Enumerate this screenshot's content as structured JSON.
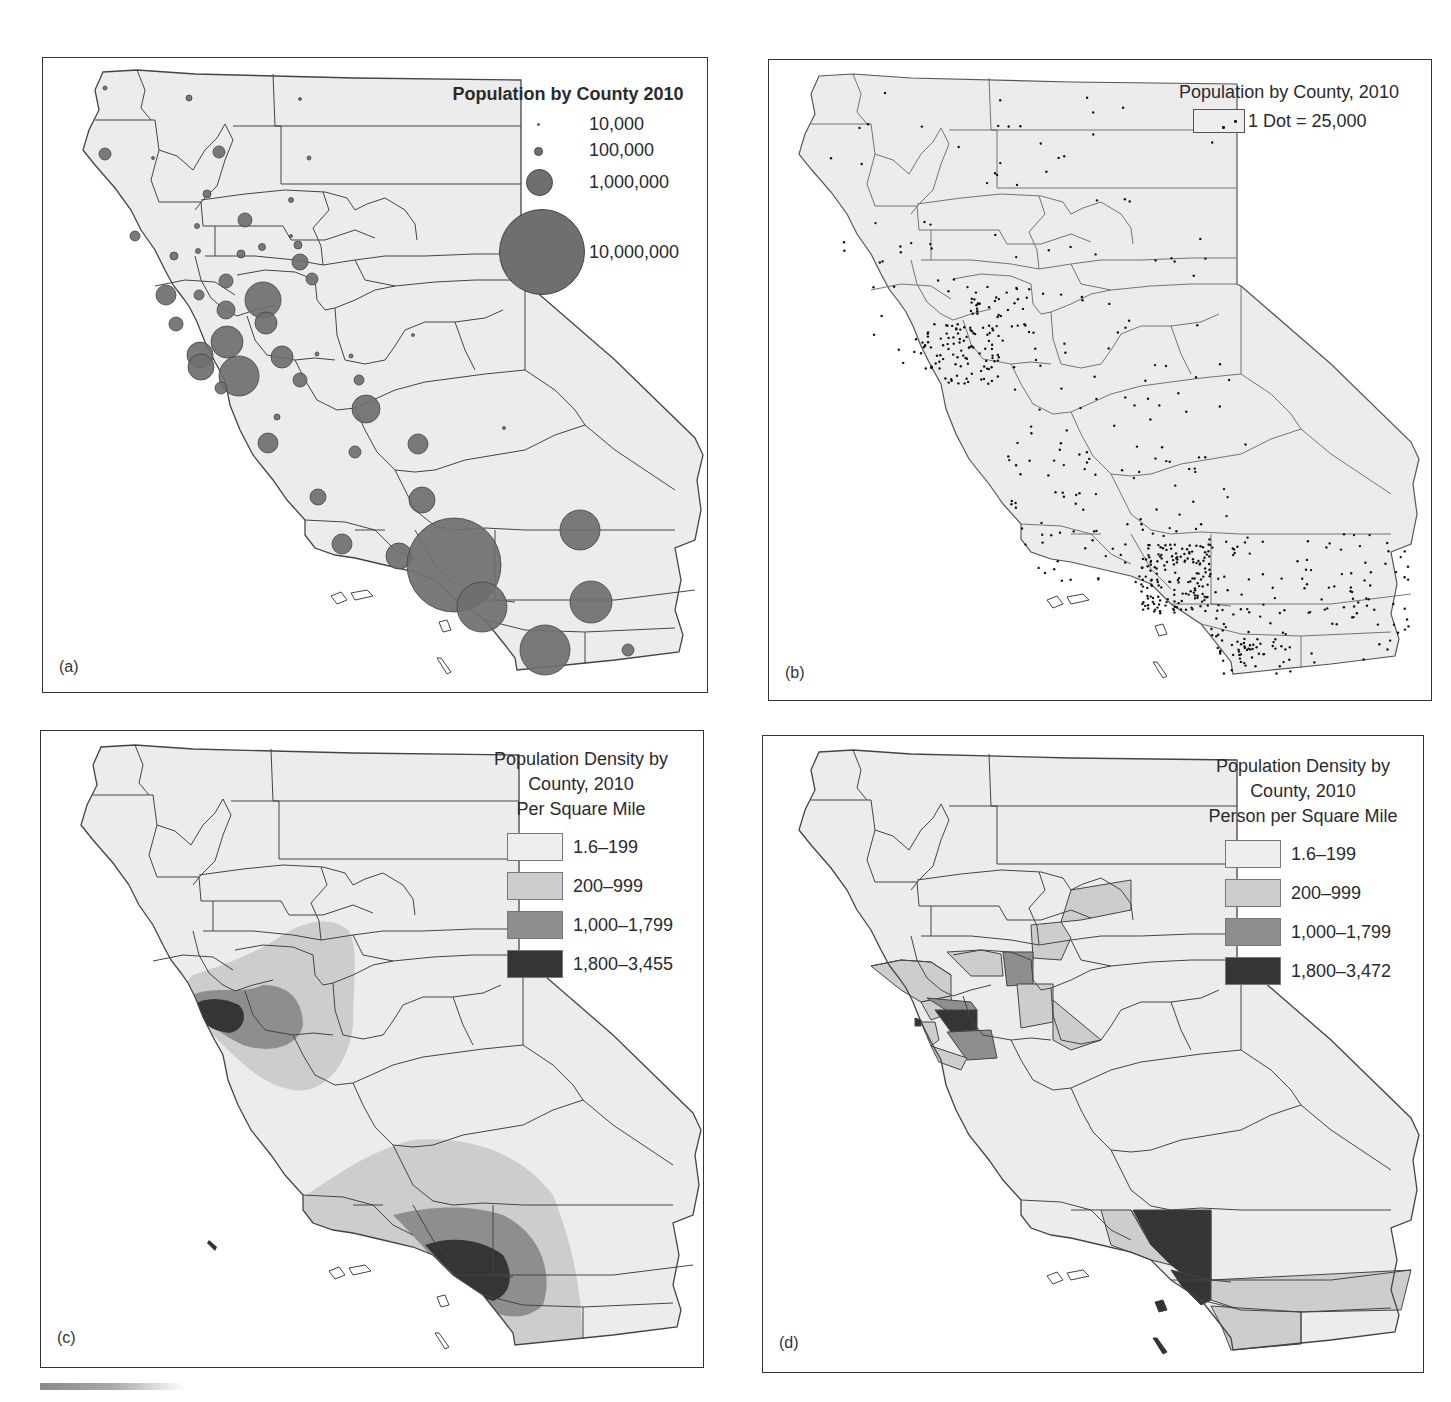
{
  "figure": {
    "panels": [
      {
        "id": "a",
        "label": "(a)",
        "map_type": "proportional-symbol",
        "legend": {
          "title": "Population by County 2010",
          "symbols": [
            {
              "label": "10,000",
              "diameter": 3
            },
            {
              "label": "100,000",
              "diameter": 9
            },
            {
              "label": "1,000,000",
              "diameter": 27
            },
            {
              "label": "10,000,000",
              "diameter": 86
            }
          ]
        }
      },
      {
        "id": "b",
        "label": "(b)",
        "map_type": "dot-density",
        "legend": {
          "title": "Population by County, 2010",
          "dot_label": "1 Dot = 25,000"
        }
      },
      {
        "id": "c",
        "label": "(c)",
        "map_type": "isopleth",
        "legend": {
          "title_lines": [
            "Population Density by",
            "County, 2010",
            "Per Square Mile"
          ],
          "classes": [
            {
              "label": "1.6–199",
              "color": "#eeeeee"
            },
            {
              "label": "200–999",
              "color": "#cdcdcd"
            },
            {
              "label": "1,000–1,799",
              "color": "#8e8e8e"
            },
            {
              "label": "1,800–3,455",
              "color": "#353535"
            }
          ]
        }
      },
      {
        "id": "d",
        "label": "(d)",
        "map_type": "choropleth",
        "legend": {
          "title_lines": [
            "Population Density by",
            "County, 2010",
            "Person per Square Mile"
          ],
          "classes": [
            {
              "label": "1.6–199",
              "color": "#eeeeee"
            },
            {
              "label": "200–999",
              "color": "#cdcdcd"
            },
            {
              "label": "1,000–1,799",
              "color": "#8e8e8e"
            },
            {
              "label": "1,800–3,472",
              "color": "#353535"
            }
          ]
        }
      }
    ],
    "colors": {
      "land": "#ececec",
      "border": "#444444",
      "symbol": "#6f6f6f",
      "dot": "#111111"
    }
  }
}
